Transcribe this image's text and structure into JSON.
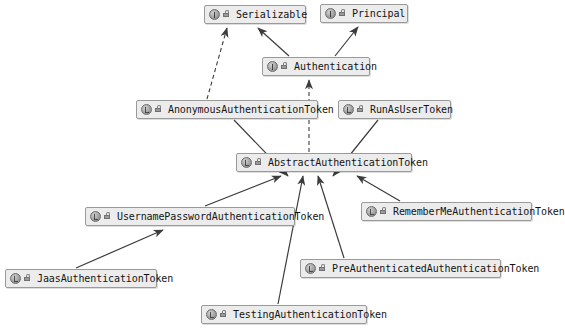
{
  "diagram": {
    "type": "uml-class-diagram",
    "background_color": "#ffffff",
    "node_fill_color": "#ececec",
    "node_border_color": "#9a9a9a",
    "edge_color": "#3c3c3c",
    "nodes": [
      {
        "id": "serializable",
        "label": "Serializable",
        "kind": "interface",
        "x": 204,
        "y": 5,
        "w": 102
      },
      {
        "id": "principal",
        "label": "Principal",
        "kind": "interface",
        "x": 320,
        "y": 4,
        "w": 88
      },
      {
        "id": "authentication",
        "label": "Authentication",
        "kind": "interface",
        "x": 262,
        "y": 57,
        "w": 108
      },
      {
        "id": "anonymous",
        "label": "AnonymousAuthenticationToken",
        "kind": "class",
        "x": 136,
        "y": 100,
        "w": 182
      },
      {
        "id": "runasuser",
        "label": "RunAsUserToken",
        "kind": "class",
        "x": 338,
        "y": 100,
        "w": 113
      },
      {
        "id": "abstract",
        "label": "AbstractAuthenticationToken",
        "kind": "class",
        "x": 236,
        "y": 153,
        "w": 176
      },
      {
        "id": "rememberme",
        "label": "RememberMeAuthenticationToken",
        "kind": "class",
        "x": 361,
        "y": 202,
        "w": 171
      },
      {
        "id": "usernamepassword",
        "label": "UsernamePasswordAuthenticationToken",
        "kind": "class",
        "x": 85,
        "y": 207,
        "w": 210
      },
      {
        "id": "preauth",
        "label": "PreAuthenticatedAuthenticationToken",
        "kind": "class",
        "x": 300,
        "y": 259,
        "w": 201
      },
      {
        "id": "jaas",
        "label": "JaasAuthenticationToken",
        "kind": "class",
        "x": 5,
        "y": 269,
        "w": 152
      },
      {
        "id": "testing",
        "label": "TestingAuthenticationToken",
        "kind": "class",
        "x": 201,
        "y": 305,
        "w": 166
      }
    ],
    "edges": [
      {
        "from": "anonymous",
        "to": "serializable",
        "style": "dashed",
        "relation": "implements"
      },
      {
        "from": "authentication",
        "to": "serializable",
        "style": "solid",
        "relation": "extends"
      },
      {
        "from": "authentication",
        "to": "principal",
        "style": "solid",
        "relation": "extends"
      },
      {
        "from": "abstract",
        "to": "authentication",
        "style": "dashed",
        "relation": "implements"
      },
      {
        "from": "anonymous",
        "to": "abstract",
        "style": "solid",
        "relation": "extends"
      },
      {
        "from": "runasuser",
        "to": "abstract",
        "style": "solid",
        "relation": "extends"
      },
      {
        "from": "usernamepassword",
        "to": "abstract",
        "style": "solid",
        "relation": "extends"
      },
      {
        "from": "testing",
        "to": "abstract",
        "style": "solid",
        "relation": "extends"
      },
      {
        "from": "preauth",
        "to": "abstract",
        "style": "solid",
        "relation": "extends"
      },
      {
        "from": "rememberme",
        "to": "abstract",
        "style": "solid",
        "relation": "extends"
      },
      {
        "from": "jaas",
        "to": "usernamepassword",
        "style": "solid",
        "relation": "extends"
      }
    ]
  }
}
